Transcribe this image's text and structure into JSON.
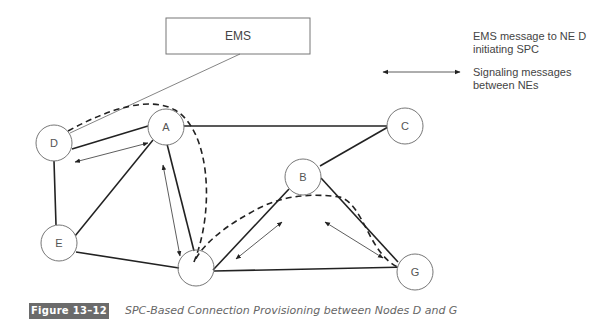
{
  "diagram": {
    "ems_box": {
      "label": "EMS"
    },
    "nodes": [
      {
        "id": "D",
        "label": "D"
      },
      {
        "id": "A",
        "label": "A"
      },
      {
        "id": "C",
        "label": "C"
      },
      {
        "id": "B",
        "label": "B"
      },
      {
        "id": "E",
        "label": "E"
      },
      {
        "id": "F",
        "label": "F"
      },
      {
        "id": "G",
        "label": "G"
      }
    ],
    "links": [
      [
        "D",
        "A"
      ],
      [
        "A",
        "C"
      ],
      [
        "D",
        "E"
      ],
      [
        "E",
        "A"
      ],
      [
        "A",
        "F"
      ],
      [
        "E",
        "F"
      ],
      [
        "F",
        "B"
      ],
      [
        "B",
        "C"
      ],
      [
        "B",
        "G"
      ],
      [
        "F",
        "G"
      ]
    ],
    "signaling_arrows": [
      [
        "D",
        "A"
      ],
      [
        "A",
        "F"
      ],
      [
        "F",
        "B"
      ],
      [
        "B",
        "G"
      ]
    ],
    "connection_path": [
      "D",
      "A",
      "F",
      "B",
      "G"
    ],
    "ems_link": [
      "EMS",
      "D"
    ]
  },
  "legend": {
    "ems_message": "EMS message to NE D\ninitiating SPC",
    "ems_message_line1": "EMS message to NE D",
    "ems_message_line2": "initiating SPC",
    "signaling_line1": "Signaling messages",
    "signaling_line2": "between NEs"
  },
  "figure": {
    "badge": "Figure 13–12",
    "caption": "SPC-Based Connection Provisioning between Nodes D and G"
  }
}
